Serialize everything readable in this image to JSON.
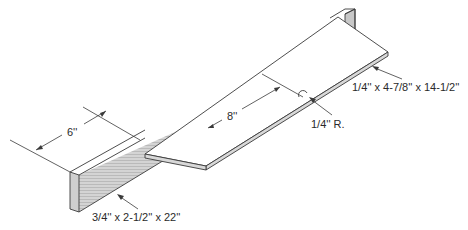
{
  "figure": {
    "type": "isometric woodworking jig drawing",
    "parts": [
      {
        "name": "fence",
        "dimensions": "3/4'' x 2-1/2'' x 22''"
      },
      {
        "name": "base-board",
        "dimensions": "1/4'' x 4-7/8'' x 14-1/2''"
      }
    ],
    "dimensions": {
      "fence_offset": "6''",
      "notch_distance": "8''",
      "notch_radius": "1/4'' R."
    },
    "colors": {
      "line": "#3a3a3a",
      "shade": "#c8c8c8",
      "background": "#ffffff"
    }
  }
}
